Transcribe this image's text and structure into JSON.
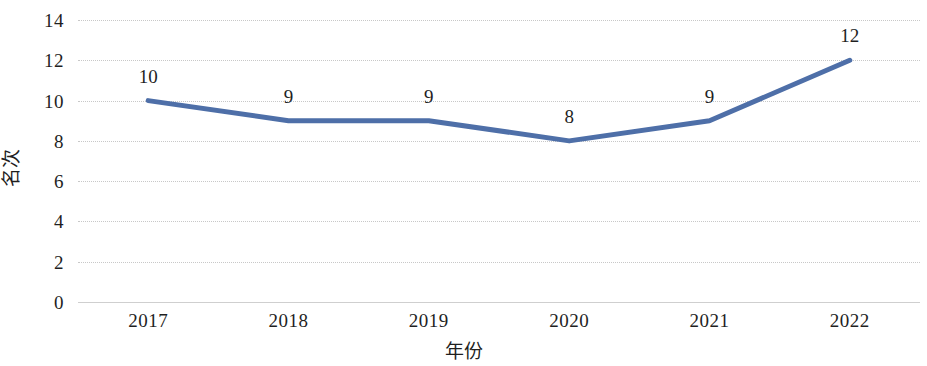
{
  "chart_data": {
    "type": "line",
    "title": "",
    "subtitle": "",
    "xlabel": "年份",
    "ylabel": "名次",
    "categories": [
      "2017",
      "2018",
      "2019",
      "2020",
      "2021",
      "2022"
    ],
    "series": [
      {
        "name": "名次",
        "values": [
          10,
          9,
          9,
          8,
          9,
          12
        ],
        "color": "#4E6FA8",
        "line_width": 5,
        "markers": false,
        "data_labels": [
          "10",
          "9",
          "9",
          "8",
          "9",
          "12"
        ]
      }
    ],
    "ylim": [
      0,
      14
    ],
    "ytick_values": [
      0,
      2,
      4,
      6,
      8,
      10,
      12,
      14
    ],
    "ytick_labels": [
      "0",
      "2",
      "4",
      "6",
      "8",
      "10",
      "12",
      "14"
    ],
    "xtick_labels": [
      "2017",
      "2018",
      "2019",
      "2020",
      "2021",
      "2022"
    ],
    "grid": {
      "horizontal": true,
      "vertical": false,
      "style": "dotted",
      "color": "#c8c8c8"
    },
    "legend": {
      "visible": false,
      "position": "none"
    },
    "axis_line_color": "#cfcfcf",
    "background": "#ffffff"
  }
}
